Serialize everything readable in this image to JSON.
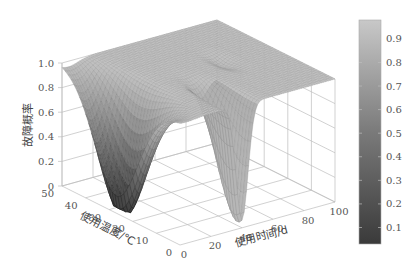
{
  "chart_data": {
    "type": "surface3d",
    "title": "",
    "zlabel": "故障概率",
    "ylabel": "使用温度/℃",
    "xlabel": "使用时间/d",
    "z_ticks": [
      "0",
      "0.2",
      "0.4",
      "0.6",
      "0.8",
      "1.0"
    ],
    "temperature_ticks": [
      "0",
      "10",
      "20",
      "30",
      "40",
      "50"
    ],
    "time_ticks": [
      "0",
      "20",
      "40",
      "60",
      "80",
      "100"
    ],
    "zlim": [
      0,
      1.0
    ],
    "temperature_range": [
      0,
      50
    ],
    "time_range": [
      0,
      100
    ],
    "colormap": "gray",
    "colorbar": {
      "ticks": [
        "0.1",
        "0.2",
        "0.3",
        "0.4",
        "0.5",
        "0.6",
        "0.7",
        "0.8",
        "0.9"
      ],
      "range": [
        0.03,
        0.98
      ]
    },
    "surface_description": "Failure probability near 1.0 over most of the domain; deep dark trough (to ~0.02) at low time (t≈0-15 d) for temperatures ~20-45 ℃ with minimum near T≈22 ℃, t≈5 d; second narrow trough near t≈35-45 d at low temperature (T≈0-15 ℃) reaching ~0.05; a slight ridge/dip feature near t≈60-70 d, T≈20-30 ℃.",
    "grid": true
  },
  "labels": {
    "zlabel": "故障概率",
    "temp_label": "使用温度/℃",
    "time_label": "使用时间/d"
  }
}
